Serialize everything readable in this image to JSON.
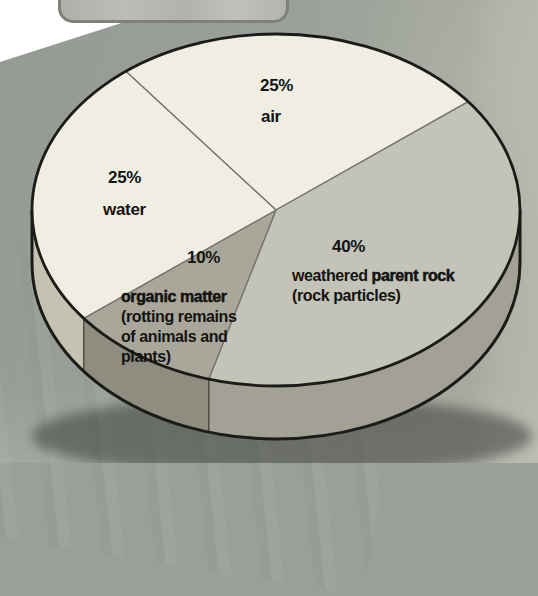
{
  "page": {
    "title": ""
  },
  "chart_data": {
    "type": "pie",
    "style": "3d-ellipse",
    "title": "",
    "legend": "none (labels placed on slices)",
    "slices": [
      {
        "id": "air",
        "label": "air",
        "sublabel": "",
        "value": 25,
        "value_label": "25%",
        "top_color": "#f0eee2",
        "side_color": "#cbc8b6"
      },
      {
        "id": "rock",
        "label": "weathered parent rock",
        "sublabel": "(rock particles)",
        "value": 40,
        "value_label": "40%",
        "top_color": "#c4c3b7",
        "side_color": "#a3a196"
      },
      {
        "id": "organic",
        "label": "organic matter",
        "sublabel": "(rotting remains of animals and plants)",
        "value": 10,
        "value_label": "10%",
        "top_color": "#a9a79a",
        "side_color": "#8f8d7f"
      },
      {
        "id": "water",
        "label": "water",
        "sublabel": "",
        "value": 25,
        "value_label": "25%",
        "top_color": "#f0eee2",
        "side_color": "#c5c2b1"
      }
    ],
    "outline_color": "#1b1b18",
    "divider_color": "#73736b"
  },
  "labels": {
    "air_pct": "25%",
    "air_name": "air",
    "water_pct": "25%",
    "water_name": "water",
    "organic_pct": "10%",
    "organic_name": "organic matter",
    "organic_sub1": "(rotting remains",
    "organic_sub2": "of animals and",
    "organic_sub3": "plants)",
    "rock_pct": "40%",
    "rock_name_1": "weathered",
    "rock_name_2": " parent rock",
    "rock_sub": "(rock particles)"
  }
}
